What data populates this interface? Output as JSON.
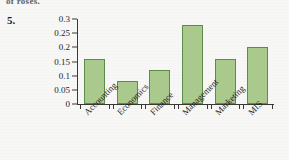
{
  "page": {
    "cutoff_text_above": "of roses.",
    "problem_number": "5."
  },
  "chart_data": {
    "type": "bar",
    "title": "",
    "xlabel": "",
    "ylabel": "",
    "categories": [
      "Accounting",
      "Economics",
      "Finance",
      "Management",
      "Marketing",
      "MIS"
    ],
    "values": [
      0.16,
      0.08,
      0.12,
      0.28,
      0.16,
      0.2
    ],
    "ylim": [
      0,
      0.3
    ],
    "ytick_values": [
      0,
      0.05,
      0.1,
      0.15,
      0.2,
      0.25,
      0.3
    ],
    "ytick_labels": [
      "0",
      "0.05",
      "0.1",
      "0.15",
      "0.2",
      "0.25",
      "0.3"
    ],
    "grid": false,
    "legend": null,
    "bar_fill_color": "#a9c98d",
    "bar_border_color": "#5c8c4b",
    "axis_color": "#3a3a33",
    "background_color": "#f2f1ee"
  }
}
